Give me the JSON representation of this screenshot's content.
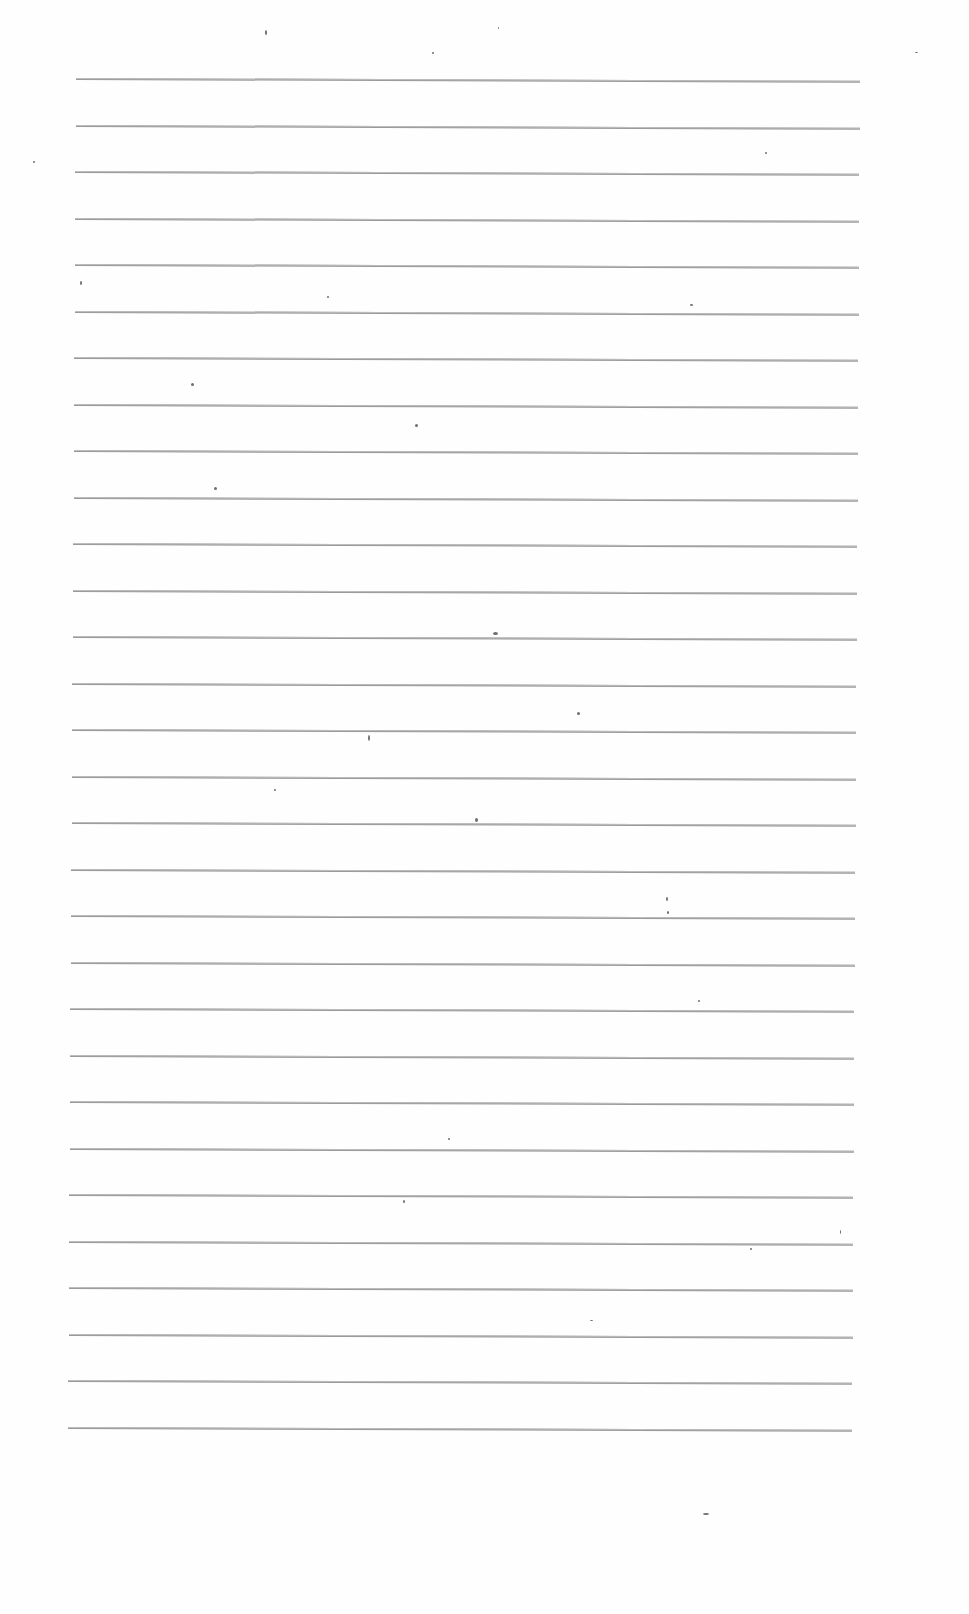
{
  "document": {
    "type": "blank ruled sheet",
    "ruled_lines": {
      "count": 30,
      "first_y": 78,
      "spacing": 46.5,
      "x_start_top": 76,
      "x_end_top": 860,
      "x_start_bottom": 68,
      "x_end_bottom": 852,
      "color": "#9a9a9a"
    },
    "specks": [
      [
        265,
        30,
        2,
        5
      ],
      [
        432,
        52,
        2,
        2
      ],
      [
        498,
        27,
        1,
        2
      ],
      [
        915,
        52,
        3,
        1
      ],
      [
        33,
        161,
        2,
        2
      ],
      [
        765,
        152,
        2,
        2
      ],
      [
        80,
        281,
        2,
        4
      ],
      [
        327,
        296,
        2,
        2
      ],
      [
        690,
        304,
        3,
        2
      ],
      [
        191,
        383,
        3,
        3
      ],
      [
        415,
        424,
        3,
        3
      ],
      [
        214,
        487,
        3,
        3
      ],
      [
        493,
        632,
        5,
        3
      ],
      [
        577,
        712,
        3,
        3
      ],
      [
        368,
        735,
        2,
        6
      ],
      [
        274,
        789,
        2,
        2
      ],
      [
        475,
        818,
        3,
        4
      ],
      [
        666,
        897,
        2,
        4
      ],
      [
        667,
        911,
        2,
        3
      ],
      [
        698,
        1000,
        2,
        2
      ],
      [
        448,
        1138,
        2,
        2
      ],
      [
        403,
        1200,
        2,
        3
      ],
      [
        750,
        1248,
        2,
        2
      ],
      [
        703,
        1513,
        6,
        2
      ],
      [
        590,
        1320,
        3,
        1
      ],
      [
        840,
        1230,
        1,
        4
      ]
    ]
  }
}
